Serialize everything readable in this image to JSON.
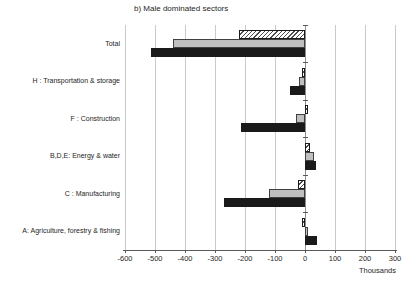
{
  "chart_data": {
    "type": "bar",
    "orientation": "horizontal",
    "title": "b) Male dominated sectors",
    "categories": [
      "Total",
      "H : Transportation & storage",
      "F : Construction",
      "B,D,E: Energy & water",
      "C : Manufacturing",
      "A: Agriculture, forestry & fishing"
    ],
    "series": [
      {
        "name": "hatched-top-series",
        "style": "hatched",
        "values": [
          -220,
          -10,
          5,
          15,
          -25,
          -2
        ]
      },
      {
        "name": "grey-middle-series",
        "style": "gray",
        "values": [
          -440,
          -20,
          -30,
          30,
          -120,
          5
        ]
      },
      {
        "name": "black-bottom-series",
        "style": "black",
        "values": [
          -515,
          -50,
          -215,
          35,
          -270,
          40
        ]
      }
    ],
    "xlabel": "Thousands",
    "ylabel": "",
    "xlim": [
      -600,
      300
    ],
    "x_ticks": [
      -600,
      -500,
      -400,
      -300,
      -200,
      -100,
      0,
      100,
      200,
      300
    ],
    "grid": true,
    "legend_position": "none"
  },
  "colors": {
    "black_bar": "#1a1a1a",
    "gray_bar": "#bfbfbf",
    "hatch_line": "#4d4d4d",
    "gridline": "#c9c9c9",
    "zero_axis": "#8f8f8f",
    "axis_line": "#595959",
    "text": "#262626",
    "background": "#ffffff"
  }
}
